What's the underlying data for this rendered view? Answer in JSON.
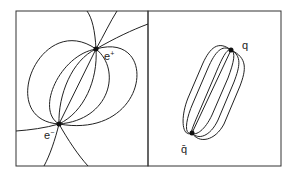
{
  "figure": {
    "left_panel": {
      "title": "electric dipole field lines",
      "charges": [
        {
          "label": "e⁺",
          "base": "e",
          "sup": "+",
          "x": 96,
          "y": 49
        },
        {
          "label": "e⁻",
          "base": "e",
          "sup": "−",
          "x": 59,
          "y": 124
        }
      ]
    },
    "right_panel": {
      "title": "color flux tube",
      "charges": [
        {
          "label": "q",
          "x": 231,
          "y": 50
        },
        {
          "label": "q̄",
          "x": 192,
          "y": 133
        }
      ]
    },
    "colors": {
      "line": "#222222",
      "frame": "#333333",
      "background": "#ffffff"
    }
  }
}
